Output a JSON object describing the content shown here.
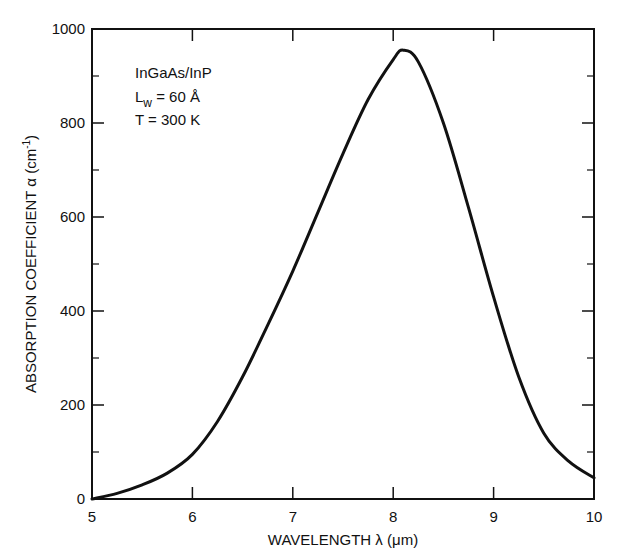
{
  "chart_data": {
    "type": "line",
    "title": "",
    "xlabel": "WAVELENGTH λ (μm)",
    "ylabel": "ABSORPTION COEFFICIENT α (cm⁻¹)",
    "xlim": [
      5,
      10
    ],
    "ylim": [
      0,
      1000
    ],
    "xticks": [
      5,
      6,
      7,
      8,
      9,
      10
    ],
    "yticks": [
      0,
      200,
      400,
      600,
      800,
      1000
    ],
    "minor_yticks": [
      100,
      300,
      500,
      700,
      900
    ],
    "grid": false,
    "legend": null,
    "annotations": [
      "InGaAs/InP",
      "L_w = 60 Å",
      "T = 300 K"
    ],
    "series": [
      {
        "name": "InGaAs/InP absorption",
        "x": [
          5.0,
          5.25,
          5.5,
          5.75,
          6.0,
          6.25,
          6.5,
          6.75,
          7.0,
          7.25,
          7.5,
          7.75,
          8.0,
          8.1,
          8.25,
          8.5,
          8.75,
          9.0,
          9.25,
          9.5,
          9.75,
          10.0
        ],
        "y": [
          0,
          12,
          30,
          55,
          95,
          165,
          260,
          370,
          485,
          610,
          735,
          850,
          935,
          955,
          930,
          800,
          620,
          430,
          260,
          140,
          80,
          45
        ]
      }
    ]
  },
  "labels": {
    "annotation_line1": "InGaAs/InP",
    "annotation_line2_prefix": "L",
    "annotation_line2_sub": "w",
    "annotation_line2_suffix": " = 60 Å",
    "annotation_line3": "T = 300 K",
    "xlabel": "WAVELENGTH  λ (μm)",
    "ylabel": "ABSORPTION COEFFICIENT α (cm",
    "ylabel_sup": "-1",
    "ylabel_end": ")"
  }
}
